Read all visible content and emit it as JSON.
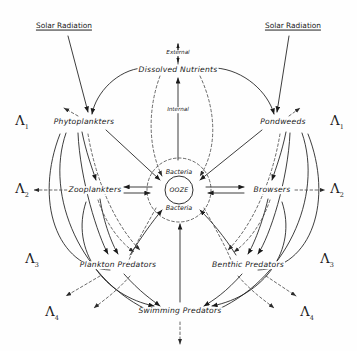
{
  "diagram": {
    "colors": {
      "ink": "#1b1b1b",
      "background": "#fefefe"
    },
    "sources": [
      {
        "id": "solar-left",
        "label": "Solar Radiation",
        "x": 64,
        "y": 26
      },
      {
        "id": "solar-right",
        "label": "Solar Radiation",
        "x": 293,
        "y": 26
      }
    ],
    "flow_labels": [
      {
        "id": "external",
        "label": "External",
        "x": 178,
        "y": 53
      },
      {
        "id": "internal",
        "label": "Internal",
        "x": 178,
        "y": 110
      }
    ],
    "nodes": [
      {
        "id": "dissolved-nutrients",
        "label": "Dissolved Nutrients",
        "x": 178,
        "y": 70
      },
      {
        "id": "phytoplankters",
        "label": "Phytoplankters",
        "x": 84,
        "y": 122
      },
      {
        "id": "pondweeds",
        "label": "Pondweeds",
        "x": 283,
        "y": 122
      },
      {
        "id": "zooplankters",
        "label": "Zooplankters",
        "x": 95,
        "y": 190
      },
      {
        "id": "browsers",
        "label": "Browsers",
        "x": 272,
        "y": 190
      },
      {
        "id": "plankton-predators",
        "label": "Plankton Predators",
        "x": 118,
        "y": 265
      },
      {
        "id": "benthic-predators",
        "label": "Benthic Predators",
        "x": 248,
        "y": 265
      },
      {
        "id": "swimming-predators",
        "label": "Swimming Predators",
        "x": 180,
        "y": 311
      }
    ],
    "core": {
      "ooze_label": "OOZE",
      "bacteria_top_label": "Bacteria",
      "bacteria_bottom_label": "Bacteria",
      "center_x": 179,
      "center_y": 190,
      "inner_radius": 14,
      "outer_radius": 32
    },
    "lambdas": [
      {
        "id": "lambda-1-left",
        "symbol": "Λ",
        "subscript": "1",
        "x": 22,
        "y": 122
      },
      {
        "id": "lambda-1-right",
        "symbol": "Λ",
        "subscript": "1",
        "x": 337,
        "y": 122
      },
      {
        "id": "lambda-2-left",
        "symbol": "Λ",
        "subscript": "2",
        "x": 22,
        "y": 190
      },
      {
        "id": "lambda-2-right",
        "symbol": "Λ",
        "subscript": "2",
        "x": 337,
        "y": 190
      },
      {
        "id": "lambda-3-left",
        "symbol": "Λ",
        "subscript": "3",
        "x": 32,
        "y": 260
      },
      {
        "id": "lambda-3-right",
        "symbol": "Λ",
        "subscript": "3",
        "x": 327,
        "y": 260
      },
      {
        "id": "lambda-4-left",
        "symbol": "Λ",
        "subscript": "4",
        "x": 52,
        "y": 313
      },
      {
        "id": "lambda-4-right",
        "symbol": "Λ",
        "subscript": "4",
        "x": 307,
        "y": 313
      }
    ]
  }
}
